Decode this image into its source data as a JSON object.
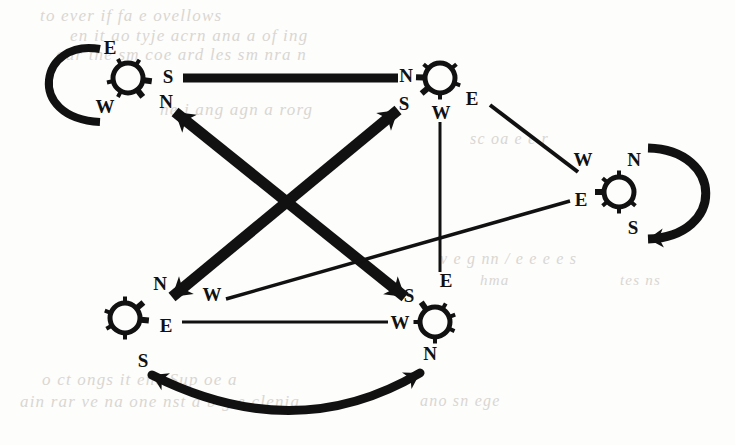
{
  "figure": {
    "kind": "directed-graph-diagram",
    "ink_color": "#111111",
    "paper_color": "#fdfdfc",
    "bleed_through_color": "#cdcac4",
    "width": 735,
    "height": 445
  },
  "nodes": [
    {
      "id": "n1",
      "name": "node-top-left",
      "cx": 128,
      "cy": 78,
      "r": 15,
      "ports": [
        {
          "name": "port-label-e",
          "label": "E",
          "x": 110,
          "y": 47
        },
        {
          "name": "port-label-s",
          "label": "S",
          "x": 168,
          "y": 76
        },
        {
          "name": "port-label-n",
          "label": "N",
          "x": 166,
          "y": 101
        },
        {
          "name": "port-label-w",
          "label": "W",
          "x": 105,
          "y": 106
        }
      ]
    },
    {
      "id": "n2",
      "name": "node-top-right",
      "cx": 440,
      "cy": 78,
      "r": 15,
      "ports": [
        {
          "name": "port-label-n",
          "label": "N",
          "x": 406,
          "y": 75
        },
        {
          "name": "port-label-s",
          "label": "S",
          "x": 404,
          "y": 103
        },
        {
          "name": "port-label-w",
          "label": "W",
          "x": 441,
          "y": 112
        },
        {
          "name": "port-label-e",
          "label": "E",
          "x": 472,
          "y": 98
        }
      ]
    },
    {
      "id": "n3",
      "name": "node-right",
      "cx": 619,
      "cy": 192,
      "r": 15,
      "ports": [
        {
          "name": "port-label-w",
          "label": "W",
          "x": 583,
          "y": 159
        },
        {
          "name": "port-label-n",
          "label": "N",
          "x": 634,
          "y": 159
        },
        {
          "name": "port-label-e",
          "label": "E",
          "x": 581,
          "y": 199
        },
        {
          "name": "port-label-s",
          "label": "S",
          "x": 633,
          "y": 227
        }
      ]
    },
    {
      "id": "n4",
      "name": "node-bottom-left",
      "cx": 125,
      "cy": 318,
      "r": 15,
      "ports": [
        {
          "name": "port-label-n",
          "label": "N",
          "x": 160,
          "y": 283
        },
        {
          "name": "port-label-w",
          "label": "W",
          "x": 212,
          "y": 294
        },
        {
          "name": "port-label-e",
          "label": "E",
          "x": 166,
          "y": 325
        },
        {
          "name": "port-label-s",
          "label": "S",
          "x": 143,
          "y": 360
        }
      ]
    },
    {
      "id": "n5",
      "name": "node-bottom-right",
      "cx": 435,
      "cy": 322,
      "r": 15,
      "ports": [
        {
          "name": "port-label-s",
          "label": "S",
          "x": 409,
          "y": 295
        },
        {
          "name": "port-label-e",
          "label": "E",
          "x": 446,
          "y": 280
        },
        {
          "name": "port-label-w",
          "label": "W",
          "x": 400,
          "y": 322
        },
        {
          "name": "port-label-n",
          "label": "N",
          "x": 430,
          "y": 353
        }
      ]
    }
  ],
  "edges": [
    {
      "name": "edge-n1-s-to-n2-n",
      "from": "n1.S",
      "to": "n2.N",
      "style": "thick-straight",
      "width": 9,
      "arrow_start": false,
      "arrow_end": false,
      "path": "M 183 78 L 398 78"
    },
    {
      "name": "edge-n1-n-to-n5-s",
      "from": "n1.N",
      "to": "n5.S",
      "style": "thick-straight",
      "width": 11,
      "arrow_start": true,
      "arrow_end": true,
      "path": "M 175 112 L 405 297"
    },
    {
      "name": "edge-n2-s-to-n4-n",
      "from": "n2.S",
      "to": "n4.N",
      "style": "thick-straight",
      "width": 11,
      "arrow_start": true,
      "arrow_end": true,
      "path": "M 398 110 L 172 297"
    },
    {
      "name": "edge-n2-e-to-n3-w",
      "from": "n2.E",
      "to": "n3.W",
      "style": "thin-straight",
      "width": 4,
      "arrow_start": false,
      "arrow_end": false,
      "path": "M 490 105 L 578 172"
    },
    {
      "name": "edge-n3-e-to-n4-w",
      "from": "n3.E",
      "to": "n4.W",
      "style": "thin-straight",
      "width": 3.5,
      "arrow_start": false,
      "arrow_end": false,
      "path": "M 570 201 L 226 299"
    },
    {
      "name": "edge-n2-w-to-n5-e",
      "from": "n2.W",
      "to": "n5.E",
      "style": "thin-straight",
      "width": 3,
      "arrow_start": false,
      "arrow_end": false,
      "path": "M 440 122 L 440 272"
    },
    {
      "name": "edge-n4-e-to-n5-w",
      "from": "n4.E",
      "to": "n5.W",
      "style": "thin-straight",
      "width": 3,
      "arrow_start": false,
      "arrow_end": false,
      "path": "M 182 322 L 388 322"
    },
    {
      "name": "edge-n4-s-to-n5-n",
      "from": "n4.S",
      "to": "n5.N",
      "style": "thick-curved",
      "width": 9,
      "arrow_start": true,
      "arrow_end": true,
      "path": "M 152 375 Q 295 447 420 373"
    }
  ],
  "self_loops": [
    {
      "name": "self-loop-node-top-left",
      "node": "n1",
      "from_port": "E",
      "to_port": "W",
      "width": 8,
      "arrow_start": false,
      "arrow_end": false,
      "path": "M 100 49 C 40 38 24 118 100 122"
    },
    {
      "name": "self-loop-node-right",
      "node": "n3",
      "from_port": "N",
      "to_port": "S",
      "width": 9,
      "arrow_start": false,
      "arrow_end": true,
      "path": "M 648 148 C 724 150 726 236 648 239"
    }
  ],
  "bleed_through_text": [
    {
      "name": "ghost-text-line",
      "text": "to  ever if   fa     e  ovellows",
      "x": 40,
      "y": 6,
      "size": 17,
      "width": 640
    },
    {
      "name": "ghost-text-line",
      "text": "en it ao tyje   acrn ana a     of ing",
      "x": 70,
      "y": 26,
      "size": 17,
      "width": 610
    },
    {
      "name": "ghost-text-line",
      "text": "our the   sm coe    ard les sm  nra  n",
      "x": 56,
      "y": 45,
      "size": 17,
      "width": 560
    },
    {
      "name": "ghost-text-line",
      "text": "ne     j  ang      agn    a  rorg",
      "x": 160,
      "y": 100,
      "size": 17,
      "width": 420
    },
    {
      "name": "ghost-text-line",
      "text": "sc    oa    e   e  r",
      "x": 470,
      "y": 130,
      "size": 16,
      "width": 240
    },
    {
      "name": "ghost-text-line",
      "text": "v   e  g  nn / e  e   e  e s",
      "x": 440,
      "y": 250,
      "size": 16,
      "width": 280
    },
    {
      "name": "ghost-text-line",
      "text": "hma",
      "x": 480,
      "y": 272,
      "size": 15,
      "width": 60
    },
    {
      "name": "ghost-text-line",
      "text": "tes    ns",
      "x": 620,
      "y": 272,
      "size": 15,
      "width": 100
    },
    {
      "name": "ghost-text-line",
      "text": "o   ct   ongs    it   enc Sup  oe a",
      "x": 42,
      "y": 370,
      "size": 17,
      "width": 560
    },
    {
      "name": "ghost-text-line",
      "text": "ain   rar  ve na one   nst a b g  e clenia",
      "x": 20,
      "y": 392,
      "size": 17,
      "width": 600
    },
    {
      "name": "ghost-text-line",
      "text": "ano     sn  ege",
      "x": 420,
      "y": 392,
      "size": 16,
      "width": 200
    }
  ]
}
